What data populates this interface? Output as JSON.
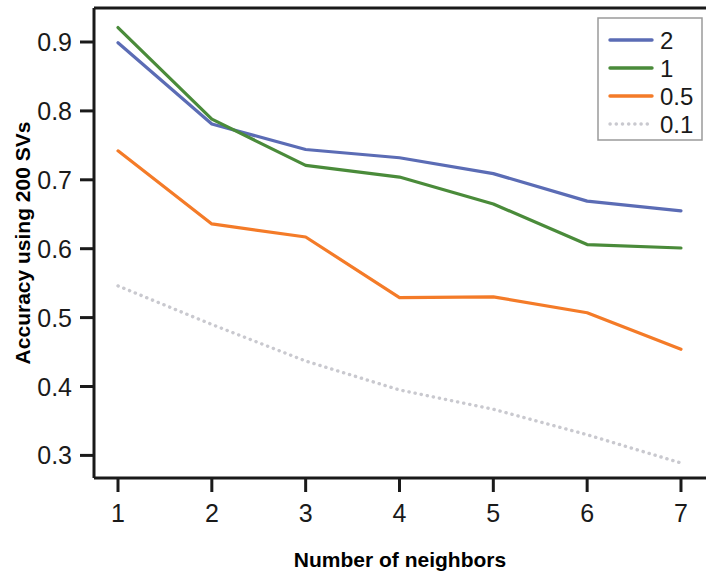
{
  "chart_data": {
    "type": "line",
    "title": "",
    "xlabel": "Number of neighbors",
    "ylabel": "Accuracy using 200 SVs",
    "x": [
      1,
      2,
      3,
      4,
      5,
      6,
      7
    ],
    "xticklabels": [
      "1",
      "2",
      "3",
      "4",
      "5",
      "6",
      "7"
    ],
    "yticks": [
      0.3,
      0.4,
      0.5,
      0.6,
      0.7,
      0.8,
      0.9
    ],
    "yticklabels": [
      "0.3",
      "0.4",
      "0.5",
      "0.6",
      "0.7",
      "0.8",
      "0.9"
    ],
    "xlim": [
      0.72,
      7.12
    ],
    "ylim": [
      0.272,
      0.962
    ],
    "grid": false,
    "legend_position": "top-right",
    "series": [
      {
        "name": "2",
        "color": "#5b6cb5",
        "style": "solid",
        "values": [
          0.899,
          0.781,
          0.744,
          0.732,
          0.709,
          0.669,
          0.655
        ]
      },
      {
        "name": "1",
        "color": "#4a8b3a",
        "style": "solid",
        "values": [
          0.921,
          0.788,
          0.721,
          0.704,
          0.665,
          0.606,
          0.601
        ]
      },
      {
        "name": "0.5",
        "color": "#f47b28",
        "style": "solid",
        "values": [
          0.742,
          0.636,
          0.617,
          0.529,
          0.53,
          0.507,
          0.454
        ]
      },
      {
        "name": "0.1",
        "color": "#c9c9cf",
        "style": "dotted",
        "values": [
          0.546,
          0.49,
          0.437,
          0.395,
          0.367,
          0.33,
          0.289
        ]
      }
    ]
  },
  "legend": {
    "entries": [
      {
        "label": "2"
      },
      {
        "label": "1"
      },
      {
        "label": "0.5"
      },
      {
        "label": "0.1"
      }
    ]
  },
  "axes": {
    "x_title": "Number of neighbors",
    "y_title": "Accuracy using 200 SVs"
  }
}
